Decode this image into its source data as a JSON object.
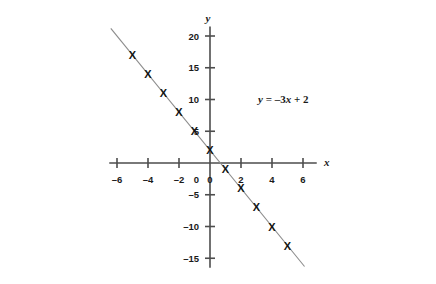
{
  "chart_data": {
    "type": "line",
    "title": "",
    "subtitle": "",
    "equation": "y = –3x + 2",
    "equation_parts": {
      "lhs": "y",
      "eq": " = ",
      "slope": "–3",
      "var": "x",
      "plus": " + ",
      "intercept": "2"
    },
    "xlabel": "x",
    "ylabel": "y",
    "xlim": [
      -6.5,
      6.5
    ],
    "ylim": [
      -16.5,
      21.5
    ],
    "xticks": [
      -6,
      -4,
      -2,
      0,
      2,
      4,
      6
    ],
    "xtick_labels": [
      "–6",
      "–4",
      "–2",
      "0",
      "2",
      "4",
      "6"
    ],
    "yticks": [
      -15,
      -10,
      -5,
      0,
      5,
      10,
      15,
      20
    ],
    "ytick_labels": [
      "–15",
      "–10",
      "–5",
      "0",
      "5",
      "10",
      "15",
      "20"
    ],
    "grid": false,
    "legend": "none",
    "line": {
      "color": "#8c8c8c",
      "width": 1.1,
      "x_start": -6.4,
      "x_end": 6.1
    },
    "marker": {
      "glyph": "X",
      "color": "#141414"
    },
    "x": [
      -5,
      -4,
      -3,
      -2,
      -1,
      0,
      1,
      2,
      3,
      4,
      5
    ],
    "y": [
      17,
      14,
      11,
      8,
      5,
      2,
      -1,
      -4,
      -7,
      -10,
      -13
    ],
    "points": [
      {
        "x": -5,
        "y": 17
      },
      {
        "x": -4,
        "y": 14
      },
      {
        "x": -3,
        "y": 11
      },
      {
        "x": -2,
        "y": 8
      },
      {
        "x": -1,
        "y": 5
      },
      {
        "x": 0,
        "y": 2
      },
      {
        "x": 1,
        "y": -1
      },
      {
        "x": 2,
        "y": -4
      },
      {
        "x": 3,
        "y": -7
      },
      {
        "x": 4,
        "y": -10
      },
      {
        "x": 5,
        "y": -13
      }
    ],
    "axis_color": "#4d4d4d"
  }
}
